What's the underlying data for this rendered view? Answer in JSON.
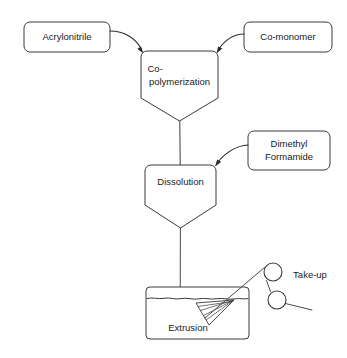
{
  "diagram": {
    "type": "process-flow-diagram",
    "background_color": "#ffffff",
    "line_color": "#3a3a3a",
    "text_color": "#1a1a1a"
  },
  "feed_boxes": [
    {
      "id": "acrylonitrile",
      "label": "Acrylonitrile",
      "lines": [
        "Acrylonitrile"
      ],
      "x": 24,
      "y": 22,
      "width": 86,
      "height": 30
    },
    {
      "id": "co-monomer",
      "label": "Co-monomer",
      "lines": [
        "Co-monomer"
      ],
      "x": 244,
      "y": 22,
      "width": 88,
      "height": 30
    },
    {
      "id": "dimethyl-formamide",
      "label": "Dimethyl Formamide",
      "lines": [
        "Dimethyl",
        "Formamide"
      ],
      "x": 248,
      "y": 131,
      "width": 82,
      "height": 39
    }
  ],
  "vessels": [
    {
      "id": "co-polymerization",
      "label": "Co-polymerization",
      "lines": [
        "Co-",
        "polymerization"
      ],
      "x": 141,
      "y": 51,
      "width": 77,
      "body_height": 47,
      "cone_height": 23
    },
    {
      "id": "dissolution",
      "label": "Dissolution",
      "lines": [
        "Dissolution"
      ],
      "x": 145,
      "y": 165,
      "width": 71,
      "body_height": 40,
      "cone_height": 23
    }
  ],
  "tank": {
    "id": "extrusion-bath",
    "label": "Extrusion",
    "x": 146,
    "y": 287,
    "width": 103,
    "height": 52,
    "water_level_y": 298
  },
  "rollers": [
    {
      "id": "take-up-roller-upper",
      "cx": 273,
      "cy": 272,
      "r": 9
    },
    {
      "id": "take-up-roller-lower",
      "cx": 277,
      "cy": 300,
      "r": 9
    }
  ],
  "take_up": {
    "label": "Take-up",
    "x": 310,
    "y": 275
  },
  "spinneret": {
    "id": "spinneret",
    "label": "spinneret"
  },
  "connectors": [
    {
      "id": "acrylonitrile-to-copolymerization",
      "from": "acrylonitrile",
      "to": "co-polymerization",
      "style": "curved-arrow"
    },
    {
      "id": "co-monomer-to-copolymerization",
      "from": "co-monomer",
      "to": "co-polymerization",
      "style": "curved-arrow"
    },
    {
      "id": "dimethyl-formamide-to-dissolution",
      "from": "dimethyl-formamide",
      "to": "dissolution",
      "style": "curved-arrow"
    },
    {
      "id": "copolymerization-to-dissolution",
      "from": "co-polymerization",
      "to": "dissolution",
      "style": "straight-line"
    },
    {
      "id": "dissolution-to-extrusion",
      "from": "dissolution",
      "to": "extrusion-bath",
      "style": "fiber-line"
    },
    {
      "id": "extrusion-to-take-up",
      "from": "extrusion-bath",
      "to": "take-up-roller-upper",
      "style": "fiber-line"
    }
  ]
}
